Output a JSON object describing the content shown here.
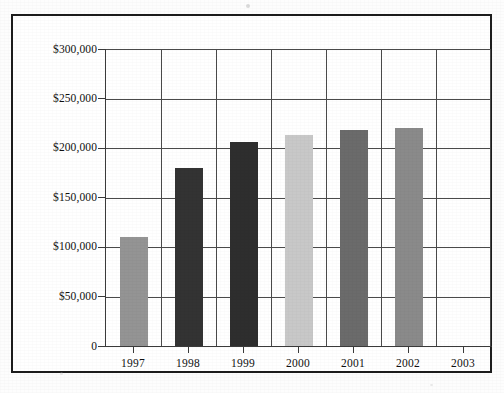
{
  "figure": {
    "title": "",
    "frame_color": "#1d1d1d",
    "background_color": "#ffffff"
  },
  "chart_data": {
    "type": "bar",
    "title": "",
    "subtitle": "",
    "xlabel": "",
    "ylabel": "",
    "categories": [
      "1997",
      "1998",
      "1999",
      "2000",
      "2001",
      "2002",
      "2003"
    ],
    "values": [
      110000,
      180000,
      206000,
      213000,
      218000,
      220000,
      null
    ],
    "series": [
      {
        "name": "Amount",
        "values": [
          110000,
          180000,
          206000,
          213000,
          218000,
          220000,
          null
        ]
      }
    ],
    "bar_colors": [
      "#949494",
      "#333333",
      "#2e2e2e",
      "#c8c8c8",
      "#6b6b6b",
      "#8a8a8a",
      "none"
    ],
    "ylim": [
      0,
      300000
    ],
    "ytick_values": [
      300000,
      250000,
      200000,
      150000,
      100000,
      50000,
      0
    ],
    "ytick_labels": [
      "$300,000",
      "$250,000",
      "$200,000",
      "$150,000",
      "$100,000",
      "$50,000",
      "0"
    ],
    "xtick_labels": [
      "1997",
      "1998",
      "1999",
      "2000",
      "2001",
      "2002",
      "2003"
    ],
    "grid": {
      "horizontal": true,
      "vertical": true,
      "color": "#4a4a4a"
    },
    "legend": {
      "visible": false,
      "position": "none",
      "entries": []
    },
    "annotations": []
  },
  "axes": {
    "y_axis_line_color": "#3a3a3a",
    "x_axis_line_color": "#3a3a3a"
  }
}
